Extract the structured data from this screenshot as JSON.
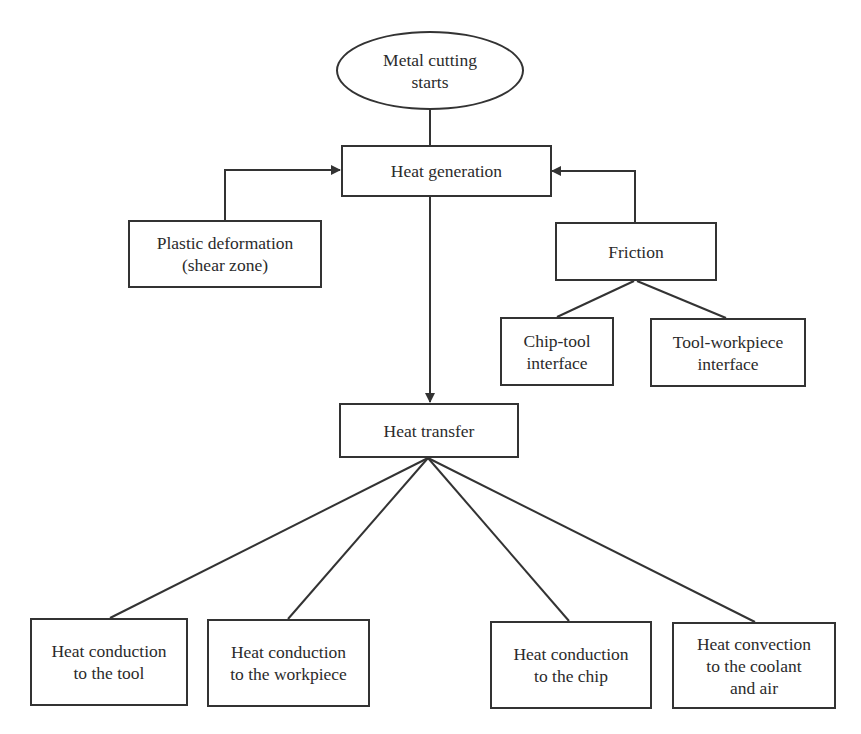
{
  "diagram": {
    "type": "flowchart",
    "title": "",
    "nodes": {
      "start": {
        "label": "Metal cutting\nstarts",
        "shape": "ellipse"
      },
      "heat_generation": {
        "label": "Heat generation",
        "shape": "rectangle"
      },
      "plastic_deformation": {
        "label": "Plastic deformation\n(shear zone)",
        "shape": "rectangle"
      },
      "friction": {
        "label": "Friction",
        "shape": "rectangle"
      },
      "chip_tool": {
        "label": "Chip-tool\ninterface",
        "shape": "rectangle"
      },
      "tool_workpiece": {
        "label": "Tool-workpiece\ninterface",
        "shape": "rectangle"
      },
      "heat_transfer": {
        "label": "Heat transfer",
        "shape": "rectangle"
      },
      "conduction_tool": {
        "label": "Heat conduction\nto the tool",
        "shape": "rectangle"
      },
      "conduction_workpiece": {
        "label": "Heat conduction\nto the workpiece",
        "shape": "rectangle"
      },
      "conduction_chip": {
        "label": "Heat conduction\nto the chip",
        "shape": "rectangle"
      },
      "convection": {
        "label": "Heat convection\nto the coolant\nand air",
        "shape": "rectangle"
      }
    },
    "edges": [
      {
        "from": "start",
        "to": "heat_generation",
        "arrow": false
      },
      {
        "from": "plastic_deformation",
        "to": "heat_generation",
        "arrow": true
      },
      {
        "from": "friction",
        "to": "heat_generation",
        "arrow": true
      },
      {
        "from": "friction",
        "to": "chip_tool",
        "arrow": false
      },
      {
        "from": "friction",
        "to": "tool_workpiece",
        "arrow": false
      },
      {
        "from": "heat_generation",
        "to": "heat_transfer",
        "arrow": true
      },
      {
        "from": "heat_transfer",
        "to": "conduction_tool",
        "arrow": false
      },
      {
        "from": "heat_transfer",
        "to": "conduction_workpiece",
        "arrow": false
      },
      {
        "from": "heat_transfer",
        "to": "conduction_chip",
        "arrow": false
      },
      {
        "from": "heat_transfer",
        "to": "convection",
        "arrow": false
      }
    ],
    "colors": {
      "line": "#333333",
      "text": "#2b2b2b",
      "background": "#ffffff"
    }
  }
}
